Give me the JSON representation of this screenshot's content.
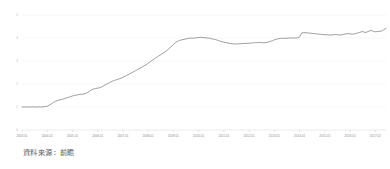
{
  "chart_data": {
    "type": "line",
    "title": "",
    "subtitle": "",
    "xlabel": "",
    "ylabel": "",
    "grid": true,
    "legend": false,
    "legend_position": "none",
    "line_color": "#8c8c8c",
    "grid_color": "#ededed",
    "axis_color": "#d4d4d4",
    "xlim": [
      "2003.01",
      "2017.06"
    ],
    "ylim": [
      0,
      5
    ],
    "ytick_labels": [
      "0",
      "1",
      "2",
      "3",
      "4",
      "5"
    ],
    "ytick_values": [
      0,
      1,
      2,
      3,
      4,
      5
    ],
    "xtick_labels": [
      "2003.01",
      "2004.01",
      "2005.01",
      "2006.01",
      "2007.01",
      "2008.01",
      "2009.01",
      "2010.01",
      "2011.01",
      "2012.01",
      "2013.01",
      "2014.01",
      "2015.01",
      "2016.01",
      "2017.01"
    ],
    "series": [
      {
        "name": "series-1",
        "color": "#8c8c8c",
        "x": [
          0.0,
          0.08,
          0.17,
          0.25,
          0.33,
          0.42,
          0.5,
          0.58,
          0.67,
          0.75,
          0.83,
          0.92,
          1.0,
          1.08,
          1.17,
          1.25,
          1.33,
          1.42,
          1.5,
          1.58,
          1.67,
          1.75,
          1.83,
          1.92,
          2.0,
          2.08,
          2.17,
          2.25,
          2.33,
          2.42,
          2.5,
          2.58,
          2.67,
          2.75,
          2.83,
          2.92,
          3.0,
          3.08,
          3.17,
          3.25,
          3.33,
          3.42,
          3.5,
          3.58,
          3.67,
          3.75,
          3.83,
          3.92,
          4.0,
          4.08,
          4.17,
          4.25,
          4.33,
          4.42,
          4.5,
          4.58,
          4.67,
          4.75,
          4.83,
          4.92,
          5.0,
          5.08,
          5.17,
          5.25,
          5.33,
          5.42,
          5.5,
          5.58,
          5.67,
          5.75,
          5.83,
          5.92,
          6.0,
          6.08,
          6.17,
          6.25,
          6.33,
          6.42,
          6.5,
          6.58,
          6.67,
          6.75,
          6.83,
          6.92,
          7.0,
          7.08,
          7.17,
          7.25,
          7.33,
          7.42,
          7.5,
          7.58,
          7.67,
          7.75,
          7.83,
          7.92,
          8.0,
          8.08,
          8.17,
          8.25,
          8.33,
          8.42,
          8.5,
          8.58,
          8.67,
          8.75,
          8.83,
          8.92,
          9.0,
          9.08,
          9.17,
          9.25,
          9.33,
          9.42,
          9.5,
          9.58,
          9.67,
          9.75,
          9.83,
          9.92,
          10.0,
          10.08,
          10.17,
          10.25,
          10.33,
          10.42,
          10.5,
          10.58,
          10.67,
          10.75,
          10.83,
          10.92,
          11.0,
          11.08,
          11.17,
          11.25,
          11.33,
          11.42,
          11.5,
          11.58,
          11.67,
          11.75,
          11.83,
          11.92,
          12.0,
          12.08,
          12.17,
          12.25,
          12.33,
          12.42,
          12.5,
          12.58,
          12.67,
          12.75,
          12.83,
          12.92,
          13.0,
          13.08,
          13.17,
          13.25,
          13.33,
          13.42,
          13.5,
          13.58,
          13.67,
          13.75,
          13.83,
          13.92,
          14.0,
          14.08,
          14.17,
          14.25,
          14.33,
          14.42
        ],
        "values": [
          1.0,
          1.0,
          1.0,
          1.0,
          1.0,
          1.01,
          1.0,
          1.0,
          1.01,
          1.0,
          1.01,
          1.02,
          1.03,
          1.08,
          1.14,
          1.2,
          1.25,
          1.29,
          1.31,
          1.33,
          1.36,
          1.39,
          1.42,
          1.45,
          1.48,
          1.5,
          1.52,
          1.54,
          1.55,
          1.56,
          1.58,
          1.62,
          1.68,
          1.74,
          1.78,
          1.8,
          1.82,
          1.84,
          1.88,
          1.93,
          1.98,
          2.03,
          2.08,
          2.12,
          2.16,
          2.19,
          2.22,
          2.25,
          2.29,
          2.34,
          2.38,
          2.43,
          2.48,
          2.53,
          2.58,
          2.63,
          2.68,
          2.73,
          2.79,
          2.84,
          2.9,
          2.97,
          3.04,
          3.1,
          3.16,
          3.22,
          3.28,
          3.34,
          3.4,
          3.47,
          3.55,
          3.63,
          3.72,
          3.8,
          3.86,
          3.9,
          3.92,
          3.94,
          3.96,
          3.98,
          4.0,
          3.99,
          4.0,
          4.01,
          4.02,
          4.03,
          4.02,
          4.01,
          4.0,
          3.99,
          3.97,
          3.95,
          3.93,
          3.9,
          3.87,
          3.84,
          3.82,
          3.8,
          3.78,
          3.76,
          3.75,
          3.74,
          3.74,
          3.75,
          3.75,
          3.76,
          3.76,
          3.77,
          3.77,
          3.78,
          3.79,
          3.8,
          3.8,
          3.81,
          3.8,
          3.79,
          3.8,
          3.82,
          3.85,
          3.88,
          3.92,
          3.95,
          3.97,
          3.98,
          3.99,
          3.99,
          3.99,
          4.0,
          4.0,
          4.0,
          4.0,
          4.01,
          4.05,
          4.22,
          4.23,
          4.23,
          4.22,
          4.21,
          4.2,
          4.19,
          4.18,
          4.17,
          4.16,
          4.15,
          4.14,
          4.14,
          4.13,
          4.13,
          4.14,
          4.15,
          4.14,
          4.13,
          4.14,
          4.16,
          4.18,
          4.19,
          4.18,
          4.17,
          4.18,
          4.2,
          4.23,
          4.26,
          4.28,
          4.24,
          4.26,
          4.3,
          4.33,
          4.29,
          4.27,
          4.28,
          4.29,
          4.3,
          4.36,
          4.42
        ]
      }
    ]
  },
  "footer": {
    "source_note": "資料來源：前瞻"
  }
}
